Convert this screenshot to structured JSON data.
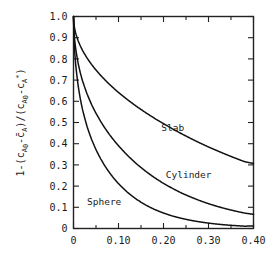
{
  "chart_data": {
    "type": "line",
    "title": "",
    "subtitle": "",
    "xlabel": "",
    "ylabel": "1-(c_A0 - cbar_A)/(c_A0 - c_A*)",
    "ylabel_parts": {
      "lead": "1-(c",
      "sub1": "A",
      "sub1b": "0",
      "mid1": "-c",
      "bar_symbol": "̄",
      "sub2": "A",
      "mid2": ")/(c",
      "sub3": "A",
      "sub3b": "0",
      "mid3": "-c",
      "sub4": "A",
      "sup4": "*",
      "tail": ")"
    },
    "xlim": [
      0,
      0.4
    ],
    "ylim": [
      0,
      1.0
    ],
    "xticks": [
      0,
      0.1,
      0.2,
      0.3,
      0.4
    ],
    "xticklabels": [
      "0",
      "0.10",
      "0.20",
      "0.30",
      "0.40"
    ],
    "xminor_step": 0.05,
    "yticks": [
      0,
      0.1,
      0.2,
      0.3,
      0.4,
      0.5,
      0.6,
      0.7,
      0.8,
      0.9,
      1.0
    ],
    "yticklabels": [
      "0",
      "0.1",
      "0.2",
      "0.3",
      "0.4",
      "0.5",
      "0.6",
      "0.7",
      "0.8",
      "0.9",
      "1.0"
    ],
    "grid": false,
    "legend_position": "inline-annotations",
    "frame": "box-all-four-sides-inward-ticks",
    "series": [
      {
        "name": "Slab",
        "geometry": "slab",
        "label_x": 0.195,
        "label_y": 0.475,
        "x": [
          0,
          0.002,
          0.005,
          0.01,
          0.015,
          0.02,
          0.03,
          0.04,
          0.05,
          0.06,
          0.07,
          0.08,
          0.09,
          0.1,
          0.12,
          0.14,
          0.16,
          0.18,
          0.2,
          0.22,
          0.24,
          0.26,
          0.28,
          0.3,
          0.32,
          0.34,
          0.36,
          0.38,
          0.4
        ],
        "values": [
          1.0,
          0.95,
          0.92,
          0.887,
          0.862,
          0.841,
          0.805,
          0.774,
          0.747,
          0.723,
          0.7,
          0.679,
          0.659,
          0.64,
          0.606,
          0.574,
          0.545,
          0.518,
          0.492,
          0.468,
          0.445,
          0.423,
          0.402,
          0.382,
          0.364,
          0.346,
          0.329,
          0.313,
          0.312
        ]
      },
      {
        "name": "Cylinder",
        "geometry": "cylinder",
        "label_x": 0.205,
        "label_y": 0.255,
        "x": [
          0,
          0.002,
          0.005,
          0.01,
          0.015,
          0.02,
          0.03,
          0.04,
          0.05,
          0.06,
          0.07,
          0.08,
          0.09,
          0.1,
          0.12,
          0.14,
          0.16,
          0.18,
          0.2,
          0.22,
          0.24,
          0.26,
          0.28,
          0.3,
          0.32,
          0.34,
          0.36,
          0.38,
          0.4
        ],
        "values": [
          1.0,
          0.902,
          0.848,
          0.78,
          0.731,
          0.692,
          0.63,
          0.58,
          0.538,
          0.501,
          0.468,
          0.438,
          0.411,
          0.386,
          0.34,
          0.3,
          0.265,
          0.234,
          0.207,
          0.183,
          0.161,
          0.143,
          0.126,
          0.111,
          0.098,
          0.087,
          0.077,
          0.068,
          0.065
        ]
      },
      {
        "name": "Sphere",
        "geometry": "sphere",
        "label_x": 0.03,
        "label_y": 0.125,
        "x": [
          0,
          0.002,
          0.005,
          0.01,
          0.015,
          0.02,
          0.03,
          0.04,
          0.05,
          0.06,
          0.07,
          0.08,
          0.09,
          0.1,
          0.12,
          0.14,
          0.16,
          0.18,
          0.2,
          0.22,
          0.24,
          0.26,
          0.28,
          0.3,
          0.32,
          0.34,
          0.36,
          0.38,
          0.4
        ],
        "values": [
          1.0,
          0.85,
          0.765,
          0.663,
          0.592,
          0.538,
          0.456,
          0.395,
          0.346,
          0.305,
          0.27,
          0.24,
          0.213,
          0.19,
          0.15,
          0.119,
          0.094,
          0.074,
          0.059,
          0.046,
          0.037,
          0.029,
          0.023,
          0.018,
          0.014,
          0.011,
          0.009,
          0.007,
          0.012
        ]
      }
    ]
  },
  "annotations": {
    "slab_label": "Slab",
    "cylinder_label": "Cylinder",
    "sphere_label": "Sphere"
  }
}
